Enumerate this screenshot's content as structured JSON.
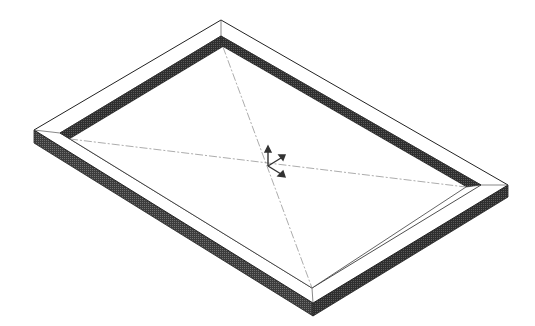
{
  "view": {
    "type": "cad-isometric-view",
    "background": "#ffffff",
    "model": "rectangular-frame",
    "colors": {
      "edge": "#222222",
      "top_face": "#ffffff",
      "inner_wall": "#3a3a3a",
      "outer_side": "#505050",
      "centerline": "#777777"
    }
  },
  "triad": {
    "label": "coordinate-triad",
    "axes": [
      "x",
      "y",
      "z"
    ]
  }
}
